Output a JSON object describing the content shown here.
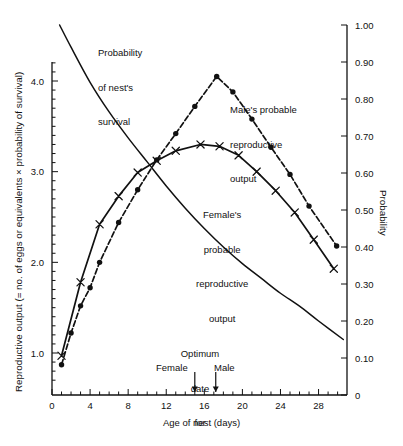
{
  "chart_data": {
    "type": "line",
    "title": "",
    "xlabel": "Age of nest (days)",
    "ylabel": "Reproductive output (= no. of eggs or equivalents × probability of survival)",
    "y2label": "Probability",
    "xlim": [
      0,
      31.8
    ],
    "ylim": [
      0.63,
      4.3
    ],
    "y2lim": [
      0,
      1.0
    ],
    "grid": false,
    "legend": "inline annotations",
    "xticks": [
      0,
      4,
      8,
      12,
      16,
      20,
      24,
      28
    ],
    "xticklabels": [
      "0",
      "4",
      "8",
      "12",
      "16",
      "20",
      "24",
      "28"
    ],
    "xminor_step": 1,
    "yticks": [
      1.0,
      2.0,
      3.0,
      4.0
    ],
    "yticklabels": [
      "1.0",
      "2.0",
      "3.0",
      "4.0"
    ],
    "yminor_step": 0.1,
    "y2ticks": [
      0,
      0.1,
      0.2,
      0.3,
      0.4,
      0.5,
      0.6,
      0.7,
      0.8,
      0.9,
      1.0
    ],
    "y2ticklabels": [
      "0",
      "0.10",
      "0.20",
      "0.30",
      "0.40",
      "0.50",
      "0.60",
      "0.70",
      "0.80",
      "0.90",
      "1.00"
    ],
    "series": [
      {
        "name": "Probability of nest's survival",
        "axis": "right",
        "style": "solid-line-no-markers",
        "marker": "none",
        "x": [
          0.8,
          2,
          4,
          6,
          8,
          10,
          12,
          14,
          16,
          18,
          20,
          22,
          24,
          26,
          28,
          30.6
        ],
        "values": [
          1.0,
          0.94,
          0.845,
          0.765,
          0.695,
          0.63,
          0.565,
          0.505,
          0.45,
          0.4,
          0.355,
          0.315,
          0.275,
          0.24,
          0.2,
          0.15
        ]
      },
      {
        "name": "Male's probable reproductive output",
        "axis": "left",
        "style": "dashed-line",
        "marker": "filled-circle",
        "x": [
          1.0,
          2.0,
          3.0,
          4.0,
          5.0,
          7.0,
          9.0,
          11.0,
          13.0,
          15.0,
          17.3,
          19.0,
          21.0,
          23.0,
          25.0,
          27.0,
          29.9
        ],
        "values": [
          0.87,
          1.22,
          1.52,
          1.72,
          2.0,
          2.44,
          2.8,
          3.13,
          3.42,
          3.72,
          4.05,
          3.88,
          3.58,
          3.27,
          2.97,
          2.62,
          2.18
        ]
      },
      {
        "name": "Female's probable reproductive output",
        "axis": "left",
        "style": "solid-line",
        "marker": "x-cross",
        "x": [
          1.0,
          3.0,
          5.0,
          7.0,
          9.0,
          11.0,
          13.0,
          15.6,
          17.6,
          19.6,
          21.5,
          23.5,
          25.5,
          27.5,
          29.6
        ],
        "values": [
          0.97,
          1.78,
          2.42,
          2.73,
          2.99,
          3.12,
          3.23,
          3.3,
          3.28,
          3.18,
          3.0,
          2.79,
          2.55,
          2.25,
          1.93
        ]
      }
    ],
    "annotations": [
      {
        "id": "survival-label",
        "text": "Probability\nof nest's\nsurvival"
      },
      {
        "id": "male-label",
        "text": "Male's probable\nreproductive\noutput"
      },
      {
        "id": "female-label",
        "text": "Female's\nprobable\nreproductive\noutput"
      },
      {
        "id": "optimum-label",
        "text": "Optimum\ndate\nfor"
      },
      {
        "id": "optimum-female",
        "text": "Female",
        "x": 15.0
      },
      {
        "id": "optimum-male",
        "text": "Male",
        "x": 17.2
      }
    ],
    "colors": {
      "line": "#111111",
      "axis": "#1a1a1a",
      "background": "#ffffff"
    }
  },
  "annotation_text": {
    "survival": "Probability\nof nest's\nsurvival",
    "survival_l1": "Probability",
    "survival_l2": "of nest's",
    "survival_l3": "survival",
    "male_l1": "Male's probable",
    "male_l2": "reproductive",
    "male_l3": "output",
    "female_l1": "Female's",
    "female_l2": "probable",
    "female_l3": "reproductive",
    "female_l4": "output",
    "optimum_l1": "Optimum",
    "optimum_l2": "date",
    "optimum_l3": "for",
    "optimum_female": "Female",
    "optimum_male": "Male"
  },
  "axis_text": {
    "ylabel": "Reproductive output (= no. of eggs or equivalents × probability of survival)",
    "xlabel": "Age of nest (days)",
    "y2label": "Probability"
  }
}
